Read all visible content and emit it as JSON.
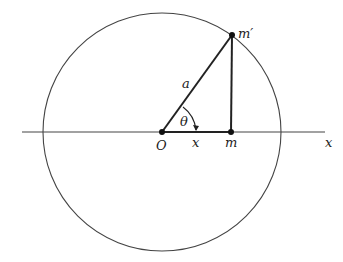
{
  "diagram": {
    "title": "",
    "colors": {
      "stroke": "#333333",
      "label": "#222222",
      "background": "#ffffff"
    },
    "circle": {
      "cx": 162,
      "cy": 132,
      "r": 119
    },
    "axis": {
      "x1": 22,
      "x2": 325,
      "y": 132
    },
    "points": {
      "O": {
        "x": 162,
        "y": 132,
        "label": "O"
      },
      "m": {
        "x": 231,
        "y": 132,
        "label": "m"
      },
      "m_prime": {
        "x": 232,
        "y": 35,
        "label": "m′"
      }
    },
    "labels": {
      "radius": "a",
      "angle": "θ",
      "segment": "x",
      "axis": "x",
      "origin": "O",
      "foot": "m",
      "top_point": "m′"
    }
  }
}
